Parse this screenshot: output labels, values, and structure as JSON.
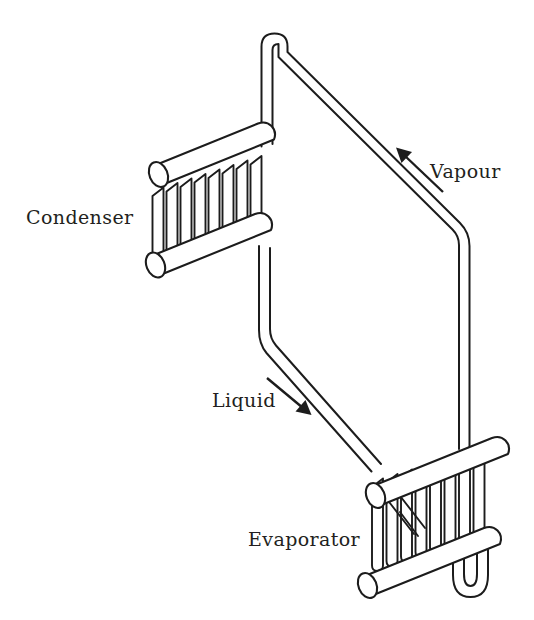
{
  "diagram": {
    "background_color": "#ffffff",
    "line_color": "#1c1c1c",
    "text_color": "#231f20",
    "labels": {
      "condenser": "Condenser",
      "evaporator": "Evaporator",
      "vapour": "Vapour",
      "liquid": "Liquid"
    },
    "components": [
      {
        "name": "condenser",
        "label": "Condenser",
        "position": "upper-left",
        "tube_count": 8,
        "header_count": 2
      },
      {
        "name": "evaporator",
        "label": "Evaporator",
        "position": "lower-right",
        "tube_count": 8,
        "header_count": 2,
        "has_return_bend": true
      }
    ],
    "flows": [
      {
        "name": "vapour",
        "label": "Vapour",
        "direction": "up-left",
        "from": "evaporator",
        "to": "condenser"
      },
      {
        "name": "liquid",
        "label": "Liquid",
        "direction": "down-right",
        "from": "condenser",
        "to": "evaporator"
      }
    ]
  }
}
